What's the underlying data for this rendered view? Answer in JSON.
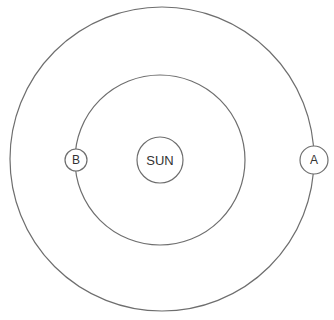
{
  "diagram": {
    "title": "",
    "orbits": [
      {
        "name": "outer-orbit",
        "cx": 162,
        "cy": 159,
        "r": 152
      },
      {
        "name": "inner-orbit",
        "cx": 160,
        "cy": 160,
        "r": 85
      }
    ],
    "bodies": [
      {
        "id": "sun",
        "label": "SUN",
        "cx": 160,
        "cy": 160,
        "r": 23,
        "font_size": 13
      },
      {
        "id": "planet-b",
        "label": "B",
        "cx": 76,
        "cy": 160,
        "r": 11,
        "font_size": 12
      },
      {
        "id": "planet-a",
        "label": "A",
        "cx": 314,
        "cy": 160,
        "r": 14,
        "font_size": 12
      }
    ],
    "colors": {
      "stroke": "#6e6e6e",
      "text": "#333333",
      "background": "#ffffff"
    }
  }
}
